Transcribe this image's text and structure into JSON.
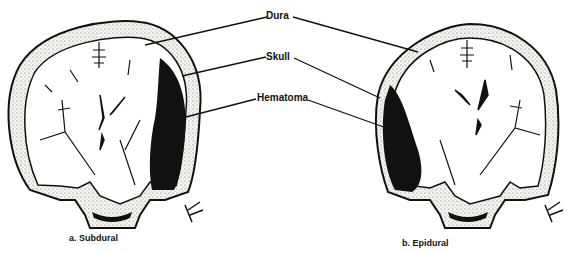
{
  "labels": {
    "dura": "Dura",
    "skull": "Skull",
    "hematoma": "Hematoma"
  },
  "captions": {
    "left": "a. Subdural",
    "right": "b. Epidural"
  },
  "colors": {
    "ink": "#111111",
    "bone_fill": "#f4f1ea",
    "background": "#ffffff"
  }
}
